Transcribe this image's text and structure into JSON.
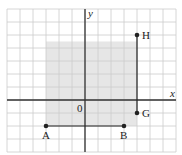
{
  "diagram": {
    "type": "coordinate-grid",
    "grid": {
      "x_min": -6,
      "x_max": 7,
      "y_min": -4,
      "y_max": 7,
      "spacing_px": 13
    },
    "origin_px": {
      "x": 85,
      "y": 100
    },
    "axes": {
      "x_label": "x",
      "y_label": "y",
      "origin_label": "0"
    },
    "shaded_region": {
      "x1": -3,
      "y1": -2,
      "x2": 4,
      "y2": 4.5,
      "color": "#e6e6e6"
    },
    "points": [
      {
        "label": "H",
        "x": 4,
        "y": 5
      },
      {
        "label": "G",
        "x": 4,
        "y": -1
      },
      {
        "label": "A",
        "x": -3,
        "y": -2
      },
      {
        "label": "B",
        "x": 3,
        "y": -2
      }
    ],
    "segments": [
      {
        "from": "G",
        "to": "H"
      },
      {
        "from": "A",
        "to": "B"
      }
    ],
    "colors": {
      "grid": "#cccccc",
      "axis": "#333333",
      "point": "#222222"
    }
  }
}
